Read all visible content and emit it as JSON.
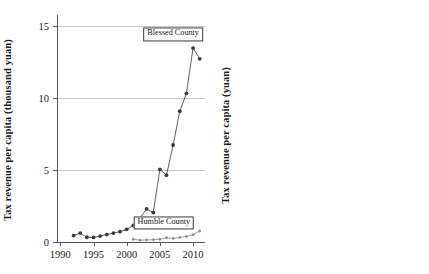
{
  "figure": {
    "panels": [
      "left",
      "right"
    ]
  },
  "chart_data": [
    {
      "type": "line",
      "panel": "left",
      "title": "",
      "xlabel": "",
      "ylabel": "Tax revenue per capita (thousand yuan)",
      "xlim": [
        1989.5,
        2011.8
      ],
      "ylim": [
        0,
        15.8
      ],
      "xticks": [
        1990,
        1995,
        2000,
        2005,
        2010
      ],
      "xticklabels": [
        "1990",
        "1995",
        "2000",
        "2005",
        "2010"
      ],
      "yticks": [
        0,
        5,
        10,
        15
      ],
      "yticklabels": [
        "0",
        "5",
        "10",
        "15"
      ],
      "grid": "horizontal",
      "legend_position": "inside-annotations",
      "annotations": [
        {
          "text": "Blessed County",
          "x": 2007.0,
          "y": 14.45
        },
        {
          "text": "Humble County",
          "x": 2005.6,
          "y": 1.35
        }
      ],
      "series": [
        {
          "name": "Blessed County",
          "marker": "filled-circle",
          "color": "#3a3a3a",
          "x": [
            1992,
            1993,
            1994,
            1995,
            1996,
            1997,
            1998,
            1999,
            2000,
            2001,
            2002,
            2003,
            2004,
            2005,
            2006,
            2007,
            2008,
            2009,
            2010,
            2011
          ],
          "values": [
            0.45,
            0.62,
            0.33,
            0.32,
            0.41,
            0.52,
            0.62,
            0.72,
            0.88,
            1.15,
            1.65,
            2.3,
            2.05,
            5.05,
            4.65,
            6.75,
            9.1,
            10.35,
            13.5,
            12.75
          ]
        },
        {
          "name": "Humble County",
          "marker": "small-diamond",
          "color": "#8a8a8a",
          "x": [
            2001,
            2002,
            2003,
            2004,
            2005,
            2006,
            2007,
            2008,
            2009,
            2010,
            2011
          ],
          "values": [
            0.19,
            0.13,
            0.14,
            0.16,
            0.19,
            0.3,
            0.25,
            0.32,
            0.39,
            0.51,
            0.77
          ]
        }
      ]
    },
    {
      "type": "line",
      "panel": "right",
      "title": "",
      "xlabel": "",
      "ylabel": "Tax revenue per capita (yuan)",
      "xlim": [
        1999.6,
        2011.7
      ],
      "ylim": [
        0,
        840
      ],
      "xticks": [
        2000,
        2005,
        2010
      ],
      "xticklabels": [
        "2000",
        "2005",
        "2010"
      ],
      "yticks": [
        0,
        200,
        400,
        600,
        800
      ],
      "yticklabels": [
        "0",
        "200",
        "400",
        "600",
        "800"
      ],
      "grid": "horizontal",
      "reference_line": {
        "orientation": "vertical",
        "x": 2005
      },
      "legend_position": "inside-annotations",
      "annotations": [
        {
          "text": "Humble County",
          "x": 2008.0,
          "y": 770
        }
      ],
      "series": [
        {
          "name": "Humble County",
          "marker": "filled-circle",
          "color": "#8a8a8a",
          "x": [
            2001,
            2002,
            2003,
            2004,
            2005,
            2006,
            2007,
            2008,
            2009,
            2010,
            2011
          ],
          "values": [
            190,
            128,
            137,
            160,
            185,
            303,
            247,
            316,
            391,
            511,
            765
          ]
        }
      ]
    }
  ]
}
